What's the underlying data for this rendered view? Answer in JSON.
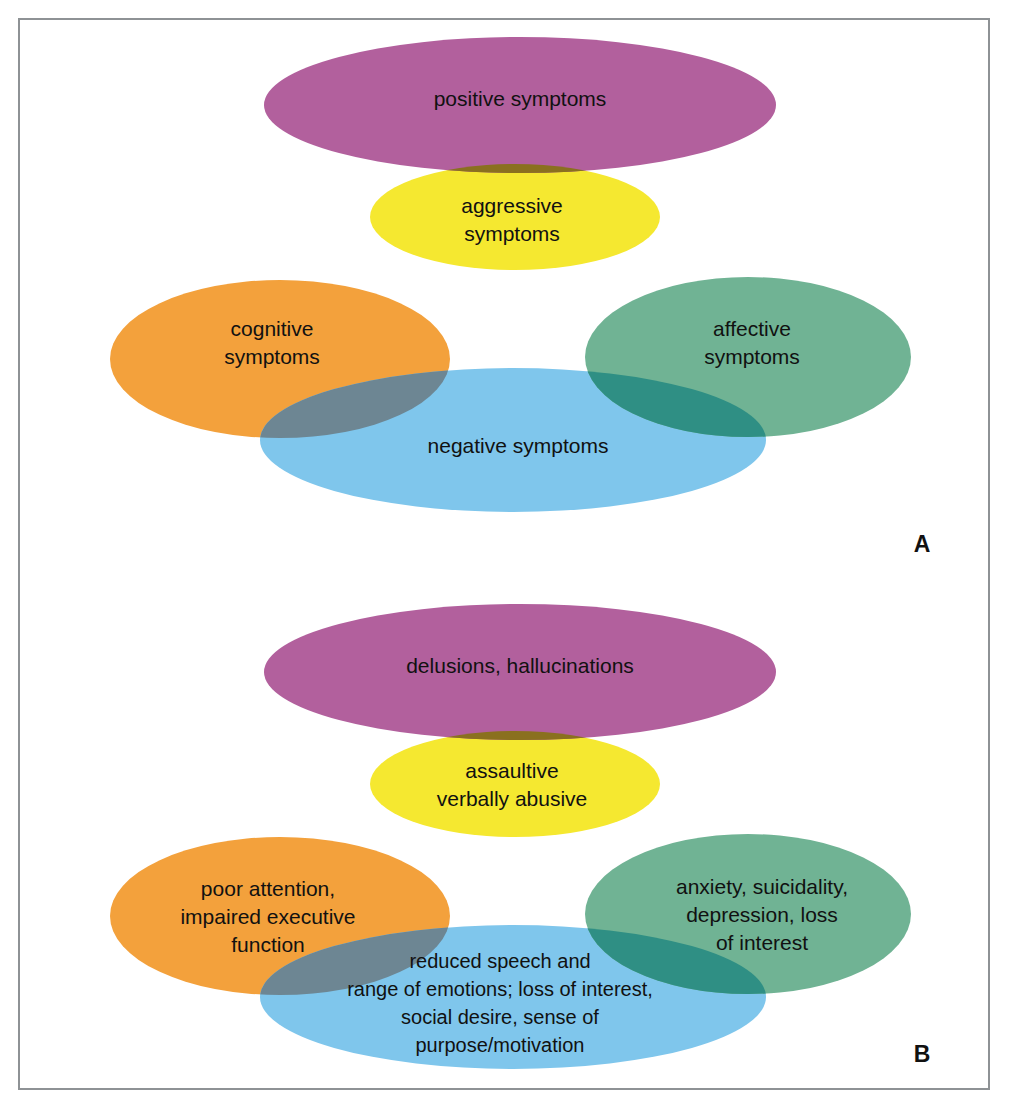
{
  "figure": {
    "frame_color": "#8e9295",
    "background": "#ffffff"
  },
  "palette": {
    "purple": "#b2609d",
    "yellow": "#f5e830",
    "orange": "#f3a13c",
    "green": "#70b394",
    "blue": "#7fc6ec",
    "purple_yellow_overlap": "#8a701f",
    "orange_blue_overlap": "#6d8693",
    "green_blue_overlap": "#2f8f84",
    "text": "#111111"
  },
  "panels": [
    {
      "letter": "A",
      "clusters": [
        {
          "name": "positive-aggressive",
          "ellipses": [
            {
              "id": "positive",
              "color_key": "purple",
              "label": "positive symptoms"
            },
            {
              "id": "aggressive",
              "color_key": "yellow",
              "label_lines": [
                "aggressive",
                "symptoms"
              ]
            }
          ]
        },
        {
          "name": "cognitive-negative-affective",
          "ellipses": [
            {
              "id": "cognitive",
              "color_key": "orange",
              "label_lines": [
                "cognitive",
                "symptoms"
              ]
            },
            {
              "id": "negative",
              "color_key": "blue",
              "label": "negative symptoms"
            },
            {
              "id": "affective",
              "color_key": "green",
              "label_lines": [
                "affective",
                "symptoms"
              ]
            }
          ]
        }
      ]
    },
    {
      "letter": "B",
      "clusters": [
        {
          "name": "delusions-assaultive",
          "ellipses": [
            {
              "id": "delusions",
              "color_key": "purple",
              "label": "delusions, hallucinations"
            },
            {
              "id": "assaultive",
              "color_key": "yellow",
              "label_lines": [
                "assaultive",
                "verbally abusive"
              ]
            }
          ]
        },
        {
          "name": "attention-reduced-anxiety",
          "ellipses": [
            {
              "id": "attention",
              "color_key": "orange",
              "label_lines": [
                "poor attention,",
                "impaired executive",
                "function"
              ]
            },
            {
              "id": "reduced",
              "color_key": "blue",
              "label_lines": [
                "reduced speech and",
                "range of emotions; loss of interest,",
                "social desire, sense of",
                "purpose/motivation"
              ]
            },
            {
              "id": "anxiety",
              "color_key": "green",
              "label_lines": [
                "anxiety, suicidality,",
                "depression, loss",
                "of interest"
              ]
            }
          ]
        }
      ]
    }
  ],
  "labels": {
    "a_positive": "positive symptoms",
    "a_aggressive_1": "aggressive",
    "a_aggressive_2": "symptoms",
    "a_cognitive_1": "cognitive",
    "a_cognitive_2": "symptoms",
    "a_negative": "negative symptoms",
    "a_affective_1": "affective",
    "a_affective_2": "symptoms",
    "a_letter": "A",
    "b_delusions": "delusions, hallucinations",
    "b_assaultive_1": "assaultive",
    "b_assaultive_2": "verbally abusive",
    "b_attention_1": "poor attention,",
    "b_attention_2": "impaired executive",
    "b_attention_3": "function",
    "b_reduced_1": "reduced speech and",
    "b_reduced_2": "range of emotions; loss of interest,",
    "b_reduced_3": "social desire, sense of",
    "b_reduced_4": "purpose/motivation",
    "b_anxiety_1": "anxiety, suicidality,",
    "b_anxiety_2": "depression, loss",
    "b_anxiety_3": "of interest",
    "b_letter": "B"
  }
}
